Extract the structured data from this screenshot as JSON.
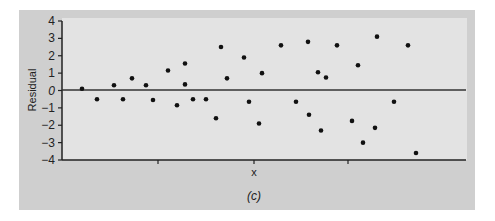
{
  "chart_data": {
    "type": "scatter",
    "title": "",
    "caption": "(c)",
    "xlabel": "x",
    "ylabel": "Residual",
    "ylim": [
      -4,
      4
    ],
    "yticks": [
      -4,
      -3,
      -2,
      -1,
      0,
      1,
      2,
      3,
      4
    ],
    "ytick_labels": [
      "-4",
      "-3",
      "-2",
      "-1",
      "0",
      "1",
      "2",
      "3",
      "4"
    ],
    "xticks_count": 3,
    "xtick_labels": [
      "",
      "",
      ""
    ],
    "grid": false,
    "reference_line": 0,
    "colors": {
      "frame": "#cfcfcf",
      "plot_bg": "#e3e3e3",
      "points": "#111111",
      "axis": "#222222"
    },
    "points": [
      {
        "x": 1,
        "y": 0.1
      },
      {
        "x": 2,
        "y": -0.5
      },
      {
        "x": 3,
        "y": 0.3
      },
      {
        "x": 4,
        "y": -0.5
      },
      {
        "x": 5,
        "y": 0.7
      },
      {
        "x": 6,
        "y": 0.3
      },
      {
        "x": 7,
        "y": -0.55
      },
      {
        "x": 8,
        "y": 1.15
      },
      {
        "x": 9,
        "y": -0.85
      },
      {
        "x": 10,
        "y": 1.55
      },
      {
        "x": 10,
        "y": 0.35
      },
      {
        "x": 11,
        "y": -0.5
      },
      {
        "x": 12,
        "y": -0.5
      },
      {
        "x": 13,
        "y": -1.6
      },
      {
        "x": 14,
        "y": 2.5
      },
      {
        "x": 14.5,
        "y": 0.7
      },
      {
        "x": 16,
        "y": 1.9
      },
      {
        "x": 16.5,
        "y": -0.65
      },
      {
        "x": 17,
        "y": -1.9
      },
      {
        "x": 17.5,
        "y": 1.0
      },
      {
        "x": 19,
        "y": 2.6
      },
      {
        "x": 20.5,
        "y": -0.65
      },
      {
        "x": 21.5,
        "y": 2.8
      },
      {
        "x": 21.6,
        "y": -1.4
      },
      {
        "x": 22.5,
        "y": 1.05
      },
      {
        "x": 23,
        "y": 0.75
      },
      {
        "x": 22.8,
        "y": -2.3
      },
      {
        "x": 24.5,
        "y": 2.6
      },
      {
        "x": 26,
        "y": -1.75
      },
      {
        "x": 26.5,
        "y": 1.45
      },
      {
        "x": 27,
        "y": -3.0
      },
      {
        "x": 28.2,
        "y": 3.1
      },
      {
        "x": 28,
        "y": -2.15
      },
      {
        "x": 30,
        "y": -0.65
      },
      {
        "x": 31.3,
        "y": 2.6
      },
      {
        "x": 32,
        "y": -3.6
      }
    ],
    "point_px": [
      [
        82,
        88
      ],
      [
        97,
        99
      ],
      [
        114,
        85
      ],
      [
        123,
        99
      ],
      [
        132,
        78
      ],
      [
        146,
        85
      ],
      [
        153,
        100
      ],
      [
        168,
        70
      ],
      [
        177,
        105
      ],
      [
        185,
        63
      ],
      [
        185,
        84
      ],
      [
        193,
        99
      ],
      [
        206,
        99
      ],
      [
        216,
        118
      ],
      [
        221,
        47
      ],
      [
        227,
        78
      ],
      [
        244,
        57
      ],
      [
        249,
        102
      ],
      [
        259,
        124
      ],
      [
        262,
        73
      ],
      [
        281,
        45
      ],
      [
        296,
        102
      ],
      [
        308,
        42
      ],
      [
        309,
        115
      ],
      [
        318,
        72
      ],
      [
        326,
        78
      ],
      [
        321,
        130
      ],
      [
        337,
        45
      ],
      [
        352,
        121
      ],
      [
        358,
        65
      ],
      [
        363,
        142
      ],
      [
        377,
        36
      ],
      [
        375,
        128
      ],
      [
        394,
        102
      ],
      [
        408,
        45
      ],
      [
        416,
        153
      ]
    ]
  }
}
